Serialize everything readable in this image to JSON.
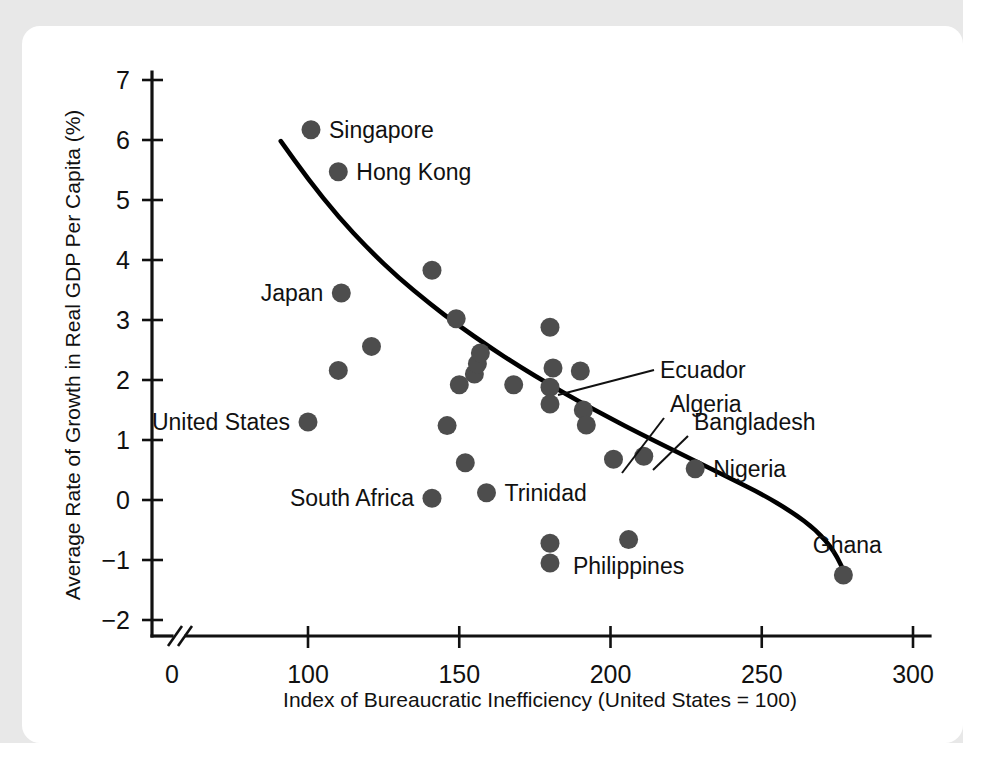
{
  "figure": {
    "kind": "scatterplot-with-fitted-curve",
    "background_color": "#ffffff",
    "frame_color": "#e8e8e8"
  },
  "chart_data": {
    "type": "scatter",
    "title": "",
    "subtitle": "",
    "xlabel": "Index of Bureaucratic Inefficiency (United States = 100)",
    "ylabel": "Average Rate of Growth in Real GDP Per Capita (%)",
    "xlim": [
      88,
      305
    ],
    "ylim": [
      -2.3,
      7.2
    ],
    "xticks": [
      0,
      100,
      150,
      200,
      250,
      300
    ],
    "xtick_labels": [
      "0",
      "100",
      "150",
      "200",
      "250",
      "300"
    ],
    "yticks": [
      -2,
      -1,
      0,
      1,
      2,
      3,
      4,
      5,
      6,
      7
    ],
    "ytick_labels": [
      "−2",
      "−1",
      "0",
      "1",
      "2",
      "3",
      "4",
      "5",
      "6",
      "7"
    ],
    "grid": false,
    "legend": null,
    "axis_break": true,
    "axis_break_note": "x-axis broken between 0 and ~90",
    "marker_color": "#4d4d4d",
    "curve_color": "#000000",
    "points": [
      {
        "x": 101,
        "y": 6.17,
        "label": "Singapore",
        "label_side": "right"
      },
      {
        "x": 110,
        "y": 5.47,
        "label": "Hong Kong",
        "label_side": "right"
      },
      {
        "x": 111,
        "y": 3.45,
        "label": "Japan",
        "label_side": "left"
      },
      {
        "x": 110,
        "y": 2.16,
        "label": null
      },
      {
        "x": 121,
        "y": 2.56,
        "label": null
      },
      {
        "x": 100,
        "y": 1.3,
        "label": "United States",
        "label_side": "left"
      },
      {
        "x": 141,
        "y": 3.83,
        "label": null
      },
      {
        "x": 149,
        "y": 3.02,
        "label": null
      },
      {
        "x": 146,
        "y": 1.24,
        "label": null
      },
      {
        "x": 141,
        "y": 0.03,
        "label": "South Africa",
        "label_side": "left"
      },
      {
        "x": 152,
        "y": 0.62,
        "label": null
      },
      {
        "x": 150,
        "y": 1.92,
        "label": null
      },
      {
        "x": 155,
        "y": 2.1,
        "label": null
      },
      {
        "x": 156,
        "y": 2.27,
        "label": null
      },
      {
        "x": 157,
        "y": 2.45,
        "label": null
      },
      {
        "x": 159,
        "y": 0.12,
        "label": "Trinidad",
        "label_side": "right"
      },
      {
        "x": 168,
        "y": 1.92,
        "label": null
      },
      {
        "x": 180,
        "y": 2.88,
        "label": null
      },
      {
        "x": 181,
        "y": 2.2,
        "label": null
      },
      {
        "x": 180,
        "y": 1.88,
        "label": null
      },
      {
        "x": 180,
        "y": 1.6,
        "label": "Ecuador",
        "label_side": "leader"
      },
      {
        "x": 190,
        "y": 2.15,
        "label": null
      },
      {
        "x": 191,
        "y": 1.5,
        "label": null
      },
      {
        "x": 192,
        "y": 1.25,
        "label": null
      },
      {
        "x": 180,
        "y": -0.72,
        "label": null
      },
      {
        "x": 180,
        "y": -1.05,
        "label": null
      },
      {
        "x": 201,
        "y": 0.68,
        "label": "Algeria",
        "label_side": "leader"
      },
      {
        "x": 206,
        "y": -0.66,
        "label": "Philippines",
        "label_side": "below"
      },
      {
        "x": 211,
        "y": 0.73,
        "label": "Bangladesh",
        "label_side": "leader"
      },
      {
        "x": 228,
        "y": 0.52,
        "label": "Nigeria",
        "label_side": "right"
      },
      {
        "x": 277,
        "y": -1.25,
        "label": "Ghana",
        "label_side": "above-right"
      }
    ],
    "curve": {
      "description": "downward-sloping fitted curve",
      "points": [
        {
          "x": 91,
          "y": 5.98
        },
        {
          "x": 100,
          "y": 5.35
        },
        {
          "x": 110,
          "y": 4.72
        },
        {
          "x": 120,
          "y": 4.18
        },
        {
          "x": 130,
          "y": 3.7
        },
        {
          "x": 140,
          "y": 3.28
        },
        {
          "x": 150,
          "y": 2.9
        },
        {
          "x": 160,
          "y": 2.55
        },
        {
          "x": 170,
          "y": 2.22
        },
        {
          "x": 180,
          "y": 1.92
        },
        {
          "x": 190,
          "y": 1.63
        },
        {
          "x": 200,
          "y": 1.36
        },
        {
          "x": 210,
          "y": 1.1
        },
        {
          "x": 220,
          "y": 0.85
        },
        {
          "x": 230,
          "y": 0.6
        },
        {
          "x": 240,
          "y": 0.35
        },
        {
          "x": 250,
          "y": 0.1
        },
        {
          "x": 260,
          "y": -0.2
        },
        {
          "x": 268,
          "y": -0.5
        },
        {
          "x": 274,
          "y": -0.85
        },
        {
          "x": 278,
          "y": -1.28
        }
      ]
    },
    "annotations": [
      {
        "text": "Ecuador",
        "points_to": {
          "x": 180,
          "y": 1.6
        }
      },
      {
        "text": "Algeria",
        "points_to": {
          "x": 201,
          "y": 0.68
        }
      },
      {
        "text": "Bangladesh",
        "points_to": {
          "x": 211,
          "y": 0.73
        }
      }
    ]
  }
}
